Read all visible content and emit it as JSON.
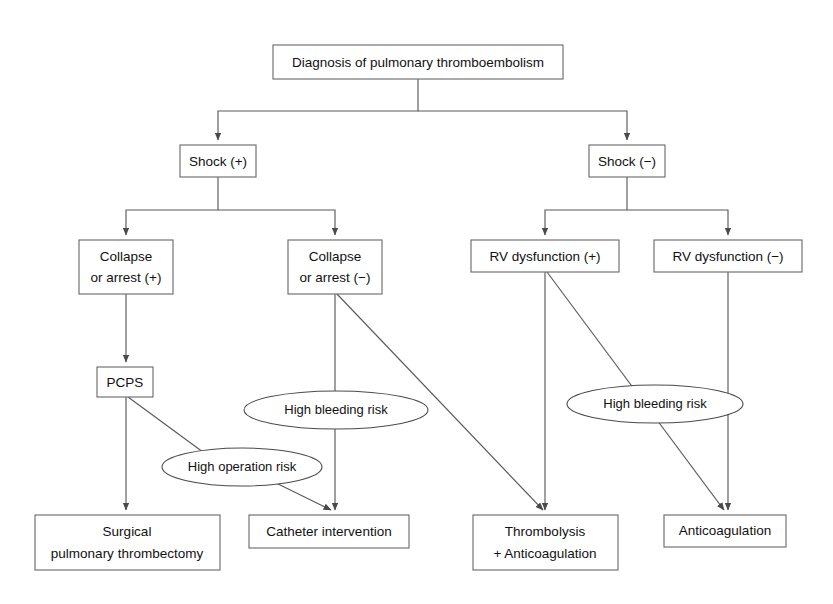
{
  "diagram": {
    "title": "Diagnosis of pulmonary thromboembolism",
    "type": "flowchart",
    "orientation": "top-down",
    "canvas": {
      "width": 833,
      "height": 604,
      "background": "#ffffff"
    },
    "style": {
      "box_stroke": "#6d6d6d",
      "ellipse_stroke": "#4a4a4a",
      "edge_stroke": "#5a5a5a",
      "text_color": "#111111",
      "fill": "#ffffff"
    },
    "nodes": [
      {
        "id": "root",
        "shape": "rect",
        "label": "Diagnosis of pulmonary thromboembolism",
        "lines": [
          "Diagnosis of pulmonary thromboembolism"
        ],
        "x": 273,
        "y": 45,
        "w": 290,
        "h": 34
      },
      {
        "id": "shock-pos",
        "shape": "rect",
        "label": "Shock (+)",
        "lines": [
          "Shock (+)"
        ],
        "x": 180,
        "y": 145,
        "w": 76,
        "h": 32
      },
      {
        "id": "shock-neg",
        "shape": "rect",
        "label": "Shock (−)",
        "lines": [
          "Shock (−)"
        ],
        "x": 589,
        "y": 145,
        "w": 76,
        "h": 32
      },
      {
        "id": "collapse-pos",
        "shape": "rect",
        "label": "Collapse or arrest (+)",
        "lines": [
          "Collapse",
          "or arrest (+)"
        ],
        "x": 79,
        "y": 240,
        "w": 94,
        "h": 54
      },
      {
        "id": "collapse-neg",
        "shape": "rect",
        "label": "Collapse or arrest (−)",
        "lines": [
          "Collapse",
          "or arrest (−)"
        ],
        "x": 288,
        "y": 240,
        "w": 94,
        "h": 54
      },
      {
        "id": "rv-pos",
        "shape": "rect",
        "label": "RV dysfunction (+)",
        "lines": [
          "RV dysfunction (+)"
        ],
        "x": 471,
        "y": 240,
        "w": 148,
        "h": 32
      },
      {
        "id": "rv-neg",
        "shape": "rect",
        "label": "RV dysfunction (−)",
        "lines": [
          "RV dysfunction (−)"
        ],
        "x": 654,
        "y": 240,
        "w": 148,
        "h": 32
      },
      {
        "id": "pcps",
        "shape": "rect",
        "label": "PCPS",
        "lines": [
          "PCPS"
        ],
        "x": 97,
        "y": 367,
        "w": 56,
        "h": 30
      },
      {
        "id": "bleeding-risk-left",
        "shape": "ellipse",
        "label": "High bleeding risk",
        "lines": [
          "High bleeding risk"
        ],
        "cx": 336,
        "cy": 410,
        "rx": 92,
        "ry": 19
      },
      {
        "id": "operation-risk",
        "shape": "ellipse",
        "label": "High operation risk",
        "lines": [
          "High operation risk"
        ],
        "cx": 242,
        "cy": 467,
        "rx": 80,
        "ry": 19
      },
      {
        "id": "bleeding-risk-right",
        "shape": "ellipse",
        "label": "High bleeding risk",
        "lines": [
          "High bleeding risk"
        ],
        "cx": 655,
        "cy": 404,
        "rx": 88,
        "ry": 19
      },
      {
        "id": "surgical",
        "shape": "rect",
        "label": "Surgical pulmonary thrombectomy",
        "lines": [
          "Surgical",
          "pulmonary thrombectomy"
        ],
        "x": 35,
        "y": 515,
        "w": 185,
        "h": 55
      },
      {
        "id": "catheter",
        "shape": "rect",
        "label": "Catheter intervention",
        "lines": [
          "Catheter intervention"
        ],
        "x": 249,
        "y": 515,
        "w": 160,
        "h": 33
      },
      {
        "id": "thrombolysis",
        "shape": "rect",
        "label": "Thrombolysis + Anticoagulation",
        "lines": [
          "Thrombolysis",
          "+ Anticoagulation"
        ],
        "x": 473,
        "y": 515,
        "w": 145,
        "h": 55
      },
      {
        "id": "anticoagulation",
        "shape": "rect",
        "label": "Anticoagulation",
        "lines": [
          "Anticoagulation"
        ],
        "x": 664,
        "y": 515,
        "w": 122,
        "h": 32
      }
    ],
    "edges": [
      {
        "id": "root-to-shock-pos",
        "from": "root",
        "to": "shock-pos",
        "kind": "orthogonal",
        "arrow": true
      },
      {
        "id": "root-to-shock-neg",
        "from": "root",
        "to": "shock-neg",
        "kind": "orthogonal",
        "arrow": true
      },
      {
        "id": "shock-pos-to-collapse-pos",
        "from": "shock-pos",
        "to": "collapse-pos",
        "kind": "orthogonal",
        "arrow": true
      },
      {
        "id": "shock-pos-to-collapse-neg",
        "from": "shock-pos",
        "to": "collapse-neg",
        "kind": "orthogonal",
        "arrow": true
      },
      {
        "id": "shock-neg-to-rv-pos",
        "from": "shock-neg",
        "to": "rv-pos",
        "kind": "orthogonal",
        "arrow": true
      },
      {
        "id": "shock-neg-to-rv-neg",
        "from": "shock-neg",
        "to": "rv-neg",
        "kind": "orthogonal",
        "arrow": true
      },
      {
        "id": "collapse-pos-to-pcps",
        "from": "collapse-pos",
        "to": "pcps",
        "kind": "straight",
        "arrow": true
      },
      {
        "id": "pcps-to-surgical",
        "from": "pcps",
        "to": "surgical",
        "kind": "straight",
        "arrow": true
      },
      {
        "id": "pcps-to-operation-risk",
        "from": "pcps",
        "to": "operation-risk",
        "kind": "diagonal",
        "arrow": false
      },
      {
        "id": "operation-risk-to-catheter",
        "from": "operation-risk",
        "to": "catheter",
        "kind": "diagonal",
        "arrow": true
      },
      {
        "id": "collapse-neg-to-catheter",
        "from": "collapse-neg",
        "to": "catheter",
        "kind": "straight",
        "arrow": true,
        "via": "bleeding-risk-left"
      },
      {
        "id": "collapse-neg-to-thrombolysis",
        "from": "collapse-neg",
        "to": "thrombolysis",
        "kind": "diagonal",
        "arrow": true
      },
      {
        "id": "rv-pos-to-thrombolysis",
        "from": "rv-pos",
        "to": "thrombolysis",
        "kind": "straight",
        "arrow": true
      },
      {
        "id": "rv-pos-to-anticoagulation",
        "from": "rv-pos",
        "to": "anticoagulation",
        "kind": "diagonal",
        "arrow": true,
        "via": "bleeding-risk-right"
      },
      {
        "id": "rv-neg-to-anticoagulation",
        "from": "rv-neg",
        "to": "anticoagulation",
        "kind": "straight",
        "arrow": true
      }
    ]
  }
}
